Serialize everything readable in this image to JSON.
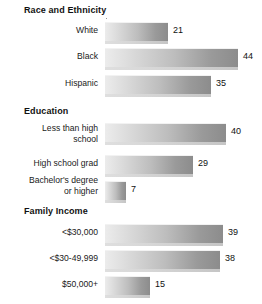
{
  "chart_data": {
    "type": "bar",
    "orientation": "horizontal",
    "title": "",
    "xlabel": "",
    "ylabel": "",
    "xlim": [
      0,
      50
    ],
    "grid": false,
    "legend": null,
    "groups": [
      {
        "heading": "Race and Ethnicity",
        "categories": [
          "White",
          "Black",
          "Hispanic"
        ],
        "values": [
          21,
          44,
          35
        ]
      },
      {
        "heading": "Education",
        "categories": [
          "Less than high school",
          "High school grad",
          "Bachelor's degree or higher"
        ],
        "values": [
          40,
          29,
          7
        ]
      },
      {
        "heading": "Family Income",
        "categories": [
          "<$30,000",
          "<$30-49,999",
          "$50,000+"
        ],
        "values": [
          39,
          38,
          15
        ]
      }
    ]
  },
  "groups": [
    {
      "heading": "Race and Ethnicity",
      "rows": [
        {
          "label_line1": "White",
          "label_line2": "",
          "value": 21,
          "value_text": "21"
        },
        {
          "label_line1": "Black",
          "label_line2": "",
          "value": 44,
          "value_text": "44"
        },
        {
          "label_line1": "Hispanic",
          "label_line2": "",
          "value": 35,
          "value_text": "35"
        }
      ]
    },
    {
      "heading": "Education",
      "rows": [
        {
          "label_line1": "Less than high",
          "label_line2": "school",
          "value": 40,
          "value_text": "40"
        },
        {
          "label_line1": "High school grad",
          "label_line2": "",
          "value": 29,
          "value_text": "29"
        },
        {
          "label_line1": "Bachelor's degree",
          "label_line2": "or higher",
          "value": 7,
          "value_text": "7"
        }
      ]
    },
    {
      "heading": "Family Income",
      "rows": [
        {
          "label_line1": "<$30,000",
          "label_line2": "",
          "value": 39,
          "value_text": "39"
        },
        {
          "label_line1": "<$30-49,999",
          "label_line2": "",
          "value": 38,
          "value_text": "38"
        },
        {
          "label_line1": "$50,000+",
          "label_line2": "",
          "value": 15,
          "value_text": "15"
        }
      ]
    }
  ],
  "style": {
    "bar_gradient_start": "#ececec",
    "bar_gradient_end": "#8c8c8c",
    "text_color": "#1a1a1a",
    "background": "#ffffff",
    "px_per_unit": 3.02,
    "bar_origin_x": 105
  }
}
